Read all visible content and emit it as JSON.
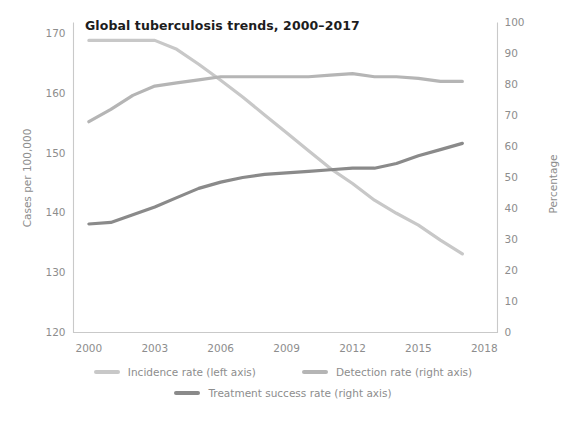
{
  "chart_data": {
    "type": "line",
    "title": "Global tuberculosis trends, 2000–2017",
    "xlabel": "",
    "ylabel": "Cases per 100,000",
    "ylabel_right": "Percentage",
    "xlim": [
      1999.3,
      2018.6
    ],
    "ylim": [
      120,
      172
    ],
    "ylim_right": [
      0,
      100
    ],
    "grid": false,
    "legend_position": "bottom",
    "xticks": [
      2000,
      2003,
      2006,
      2009,
      2012,
      2015,
      2018
    ],
    "xtick_labels": [
      "2000",
      "2003",
      "2006",
      "2009",
      "2012",
      "2015",
      "2018"
    ],
    "yticks_left": [
      120,
      130,
      140,
      150,
      160,
      170
    ],
    "ytick_labels_left": [
      "120",
      "130",
      "140",
      "150",
      "160",
      "170"
    ],
    "yticks_right": [
      0,
      10,
      20,
      30,
      40,
      50,
      60,
      70,
      80,
      90,
      100
    ],
    "ytick_labels_right": [
      "0",
      "10",
      "20",
      "30",
      "40",
      "50",
      "60",
      "70",
      "80",
      "90",
      "100"
    ],
    "x": [
      2000,
      2001,
      2002,
      2003,
      2004,
      2005,
      2006,
      2007,
      2008,
      2009,
      2010,
      2011,
      2012,
      2013,
      2014,
      2015,
      2016,
      2017
    ],
    "series": [
      {
        "name": "Incidence rate (left axis)",
        "label": "Incidence rate (left axis)",
        "axis": "left",
        "color": "#c8c8c8",
        "unit": "cases per 100,000",
        "values": [
          169.0,
          169.0,
          169.0,
          169.0,
          167.5,
          165.0,
          162.3,
          159.5,
          156.5,
          153.5,
          150.5,
          147.5,
          145.0,
          142.2,
          140.0,
          138.0,
          135.5,
          133.2
        ]
      },
      {
        "name": "Detection rate (right axis)",
        "label": "Detection rate (right axis)",
        "axis": "right",
        "color": "#b5b5b5",
        "unit": "percent",
        "values": [
          68.0,
          72.0,
          76.5,
          79.5,
          80.5,
          81.5,
          82.5,
          82.5,
          82.5,
          82.5,
          82.5,
          83.0,
          83.5,
          82.5,
          82.5,
          82.0,
          81.0,
          81.0
        ]
      },
      {
        "name": "Treatment success rate (right axis)",
        "label": "Treatment success rate (right axis)",
        "axis": "right",
        "color": "#8a8a8a",
        "unit": "percent",
        "values": [
          35.0,
          35.5,
          38.0,
          40.5,
          43.5,
          46.5,
          48.5,
          50.0,
          51.0,
          51.5,
          52.0,
          52.5,
          53.0,
          53.0,
          54.5,
          57.0,
          59.0,
          61.0
        ]
      }
    ]
  },
  "colors": {
    "axis": "#c9c9c9",
    "tick_text": "#8d8d8d",
    "title_text": "#1d1d1d",
    "background": "#ffffff"
  }
}
